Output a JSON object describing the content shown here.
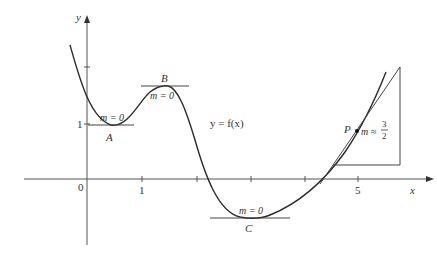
{
  "figure": {
    "function_label": "y = f(x)",
    "axes": {
      "x_label": "x",
      "y_label": "y",
      "origin_label": "0",
      "x_tick_labels": [
        "1",
        "5"
      ],
      "y_tick_labels": [
        "1"
      ]
    },
    "points": [
      {
        "name": "A",
        "slope_label": "m = 0",
        "type": "local minimum"
      },
      {
        "name": "B",
        "slope_label": "m = 0",
        "type": "local maximum"
      },
      {
        "name": "C",
        "slope_label": "m = 0",
        "type": "local minimum"
      },
      {
        "name": "P",
        "slope_label": "m ≈",
        "slope_num": "3",
        "slope_den": "2",
        "type": "point with tangent"
      }
    ],
    "colors": {
      "curve": "#2a2a2a",
      "axis": "#555555",
      "tangent": "#444444"
    }
  }
}
